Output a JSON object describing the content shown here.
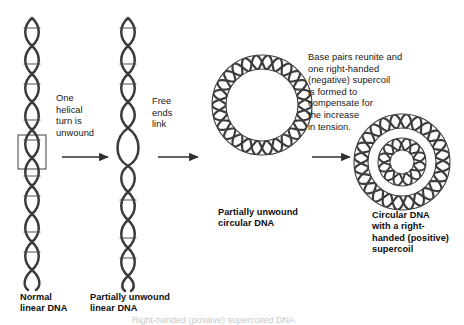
{
  "figure": {
    "background_color": "#ffffff",
    "stroke_color": "#3a3a3a",
    "text_color": "#171717"
  },
  "annotations": {
    "step1": "One\nhelical\nturn is\nunwound",
    "step2": "Free\nends\nlink",
    "step3": "Base pairs reunite and\none right-handed\n(negative) supercoil\nis formed to\ncompensate for\nthe increase\nin tension."
  },
  "captions": {
    "normal_linear": "Normal\nlinear DNA",
    "partially_unwound_linear": "Partially unwound\nlinear DNA",
    "partially_unwound_circular": "Partially unwound\ncircular DNA",
    "supercoiled_circular": "Circular DNA\nwith a right-\nhanded (positive)\nsupercoil"
  },
  "footer": {
    "clipped_caption": "Right-handed (positive) supercoiled DNA"
  },
  "panels": [
    {
      "id": "panel-normal-linear-dna",
      "kind": "linear-helix",
      "label": "Normal linear DNA",
      "highlight_box": true
    },
    {
      "id": "panel-partially-unwound-linear-dna",
      "kind": "linear-helix-with-bubble",
      "label": "Partially unwound linear DNA",
      "highlight_box": false
    },
    {
      "id": "panel-partially-unwound-circular-dna",
      "kind": "circular-helix",
      "label": "Partially unwound circular DNA",
      "highlight_box": false
    },
    {
      "id": "panel-supercoiled-circular-dna",
      "kind": "circular-helix-supercoiled",
      "label": "Circular DNA with a right-handed (positive) supercoil",
      "highlight_box": false
    }
  ],
  "arrows": [
    {
      "id": "arrow-step-1",
      "from": "panel-normal-linear-dna",
      "to": "panel-partially-unwound-linear-dna"
    },
    {
      "id": "arrow-step-2",
      "from": "panel-partially-unwound-linear-dna",
      "to": "panel-partially-unwound-circular-dna"
    },
    {
      "id": "arrow-step-3",
      "from": "panel-partially-unwound-circular-dna",
      "to": "panel-supercoiled-circular-dna"
    }
  ]
}
